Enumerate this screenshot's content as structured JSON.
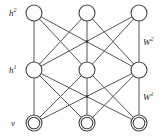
{
  "diagram": {
    "type": "deep-boltzmann-machine",
    "layers": [
      {
        "id": "h2",
        "label": "h",
        "sup": "2",
        "y": 13,
        "node_style": "single"
      },
      {
        "id": "h1",
        "label": "h",
        "sup": "1",
        "y": 70,
        "node_style": "single"
      },
      {
        "id": "v",
        "label": "v",
        "sup": "",
        "y": 123,
        "node_style": "double"
      }
    ],
    "node_x": [
      34,
      87,
      139
    ],
    "node_radius": 8,
    "weights": [
      {
        "id": "W2",
        "label": "W",
        "sup": "2",
        "between": [
          "h2",
          "h1"
        ]
      },
      {
        "id": "W1",
        "label": "W",
        "sup": "1",
        "between": [
          "h1",
          "v"
        ]
      }
    ],
    "connectivity": "fully-connected between adjacent layers",
    "colors": {
      "stroke": "#444444",
      "fill": "#ffffff",
      "background": "#ffffff"
    }
  }
}
